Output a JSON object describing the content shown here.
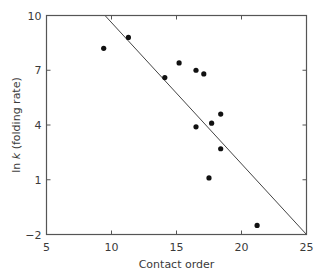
{
  "chart_data": {
    "type": "scatter",
    "title": "",
    "xlabel": "Contact order",
    "ylabel_parts": [
      {
        "text": "ln ",
        "italic": false
      },
      {
        "text": "k",
        "italic": true
      },
      {
        "text": " (folding rate)",
        "italic": false
      }
    ],
    "ylabel": "ln k (folding rate)",
    "xlim": [
      5,
      25
    ],
    "ylim": [
      -2,
      10
    ],
    "xticks": [
      5,
      10,
      15,
      20,
      25
    ],
    "yticks": [
      -2,
      1,
      4,
      7,
      10
    ],
    "grid": false,
    "legend": null,
    "points": [
      {
        "x": 9.4,
        "y": 8.2
      },
      {
        "x": 11.3,
        "y": 8.8
      },
      {
        "x": 14.1,
        "y": 6.6
      },
      {
        "x": 15.2,
        "y": 7.4
      },
      {
        "x": 16.5,
        "y": 7.0
      },
      {
        "x": 17.1,
        "y": 6.8
      },
      {
        "x": 18.4,
        "y": 4.6
      },
      {
        "x": 17.7,
        "y": 4.1
      },
      {
        "x": 16.5,
        "y": 3.9
      },
      {
        "x": 18.4,
        "y": 2.7
      },
      {
        "x": 17.5,
        "y": 1.1
      },
      {
        "x": 21.2,
        "y": -1.5
      }
    ],
    "fit_line": {
      "x": [
        9.5,
        25
      ],
      "y": [
        10,
        -2
      ]
    }
  }
}
